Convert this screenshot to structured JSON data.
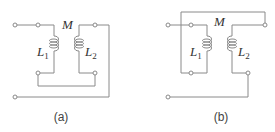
{
  "diagrams": [
    {
      "id": "a",
      "caption": "(a)",
      "mutual_label": "M",
      "coil1": {
        "symbol": "L",
        "subscript": "1"
      },
      "coil2": {
        "symbol": "L",
        "subscript": "2"
      }
    },
    {
      "id": "b",
      "caption": "(b)",
      "mutual_label": "M",
      "coil1": {
        "symbol": "L",
        "subscript": "1"
      },
      "coil2": {
        "symbol": "L",
        "subscript": "2"
      }
    }
  ],
  "colors": {
    "wire": "#8a8a8a",
    "text": "#333333"
  }
}
